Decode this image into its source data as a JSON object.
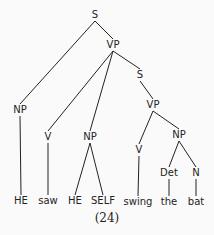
{
  "diagram": {
    "type": "syntax-tree",
    "caption": "(24)",
    "nodes": [
      {
        "id": "S1",
        "label": "S",
        "x": 95,
        "y": 15
      },
      {
        "id": "VP1",
        "label": "VP",
        "x": 113,
        "y": 45
      },
      {
        "id": "S2",
        "label": "S",
        "x": 140,
        "y": 75
      },
      {
        "id": "NP1",
        "label": "NP",
        "x": 20,
        "y": 110
      },
      {
        "id": "VP2",
        "label": "VP",
        "x": 153,
        "y": 105
      },
      {
        "id": "V1",
        "label": "V",
        "x": 48,
        "y": 137
      },
      {
        "id": "NP2",
        "label": "NP",
        "x": 90,
        "y": 137
      },
      {
        "id": "V2",
        "label": "V",
        "x": 139,
        "y": 150
      },
      {
        "id": "NP3",
        "label": "NP",
        "x": 179,
        "y": 135
      },
      {
        "id": "Det",
        "label": "Det",
        "x": 169,
        "y": 173
      },
      {
        "id": "N",
        "label": "N",
        "x": 196,
        "y": 173
      },
      {
        "id": "w1",
        "label": "HE",
        "x": 21,
        "y": 201
      },
      {
        "id": "w2",
        "label": "saw",
        "x": 48,
        "y": 201
      },
      {
        "id": "w3",
        "label": "HE",
        "x": 75,
        "y": 201
      },
      {
        "id": "w4",
        "label": "SELF",
        "x": 103,
        "y": 201
      },
      {
        "id": "w5",
        "label": "swing",
        "x": 138,
        "y": 202
      },
      {
        "id": "w6",
        "label": "the",
        "x": 169,
        "y": 202
      },
      {
        "id": "w7",
        "label": "bat",
        "x": 196,
        "y": 202
      }
    ],
    "edges": [
      [
        "S1",
        "NP1"
      ],
      [
        "S1",
        "VP1"
      ],
      [
        "VP1",
        "V1"
      ],
      [
        "VP1",
        "NP2"
      ],
      [
        "VP1",
        "S2"
      ],
      [
        "S2",
        "VP2"
      ],
      [
        "VP2",
        "V2"
      ],
      [
        "VP2",
        "NP3"
      ],
      [
        "NP3",
        "Det"
      ],
      [
        "NP3",
        "N"
      ],
      [
        "NP1",
        "w1"
      ],
      [
        "V1",
        "w2"
      ],
      [
        "NP2",
        "w3"
      ],
      [
        "NP2",
        "w4"
      ],
      [
        "V2",
        "w5"
      ],
      [
        "Det",
        "w6"
      ],
      [
        "N",
        "w7"
      ]
    ],
    "caption_pos": {
      "x": 107,
      "y": 218
    }
  }
}
